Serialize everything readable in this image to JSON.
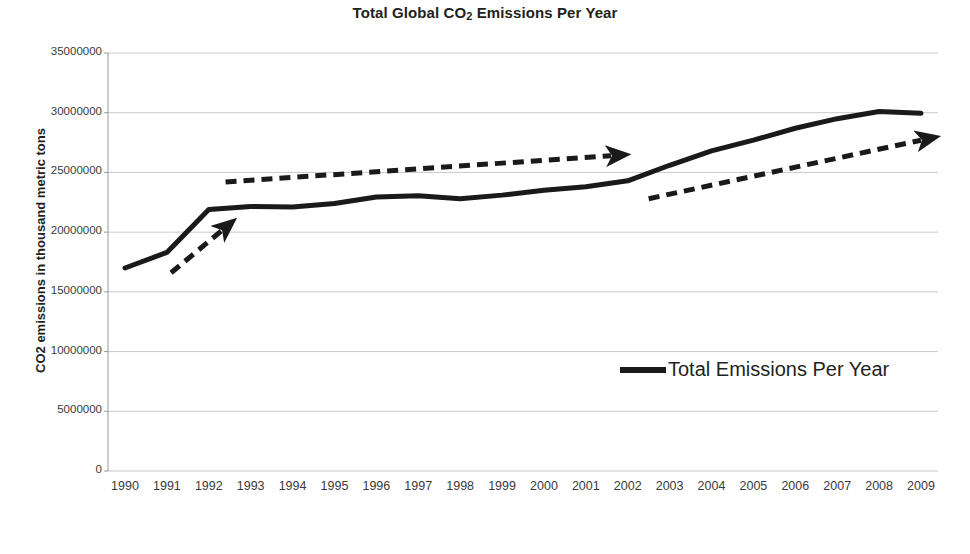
{
  "chart_data": {
    "type": "line",
    "title": "Total Global CO2 Emissions Per Year",
    "title_prefix": "Total Global CO",
    "title_sub": "2",
    "title_suffix": " Emissions Per Year",
    "xlabel": "Year",
    "ylabel": "CO2 emissions in thousand metric tons",
    "categories": [
      1990,
      1991,
      1992,
      1993,
      1994,
      1995,
      1996,
      1997,
      1998,
      1999,
      2000,
      2001,
      2002,
      2003,
      2004,
      2005,
      2006,
      2007,
      2008,
      2009
    ],
    "x_tick_labels": [
      "1990",
      "1991",
      "1992",
      "1993",
      "1994",
      "1995",
      "1996",
      "1997",
      "1998",
      "1999",
      "2000",
      "2001",
      "2002",
      "2003",
      "2004",
      "2005",
      "2006",
      "2007",
      "2008",
      "2009"
    ],
    "y_tick_labels": [
      "35000000",
      "30000000",
      "25000000",
      "20000000",
      "15000000",
      "10000000",
      "5000000",
      "0"
    ],
    "y_tick_values": [
      35000000,
      30000000,
      25000000,
      20000000,
      15000000,
      10000000,
      5000000,
      0
    ],
    "ylim": [
      0,
      35000000
    ],
    "grid": true,
    "legend_position": "inside-right",
    "series": [
      {
        "name": "Total Emissions Per Year",
        "color": "#1a1a1a",
        "values": [
          17000000,
          18300000,
          21900000,
          22150000,
          22100000,
          22400000,
          22950000,
          23050000,
          22800000,
          23100000,
          23500000,
          23800000,
          24300000,
          25600000,
          26800000,
          27700000,
          28700000,
          29500000,
          30100000,
          29950000
        ]
      }
    ],
    "annotations": [
      {
        "name": "trend-arrow-1990-1992",
        "style": "dashed-arrow",
        "color": "#1a1a1a",
        "from": {
          "year": 1991.1,
          "value": 16600000
        },
        "to": {
          "year": 1992.3,
          "value": 20100000
        },
        "description": "steep rising trend 1990-1992"
      },
      {
        "name": "trend-arrow-1992-2002",
        "style": "dashed-arrow",
        "color": "#1a1a1a",
        "from": {
          "year": 1992.4,
          "value": 24200000
        },
        "to": {
          "year": 2001.6,
          "value": 26400000
        },
        "description": "flat / slow rise plateau 1992-2002"
      },
      {
        "name": "trend-arrow-2002-2009",
        "style": "dashed-arrow",
        "color": "#1a1a1a",
        "from": {
          "year": 2002.5,
          "value": 22800000
        },
        "to": {
          "year": 2009.0,
          "value": 27700000
        },
        "description": "renewed rising trend 2002-2009"
      }
    ]
  },
  "legend": {
    "entries": [
      {
        "label": "Total Emissions Per Year",
        "color": "#1a1a1a"
      }
    ]
  },
  "colors": {
    "background": "#ffffff",
    "gridline": "#c9c9c9",
    "axis": "#9a9a9a",
    "series": "#1a1a1a",
    "text": "#231f20"
  }
}
